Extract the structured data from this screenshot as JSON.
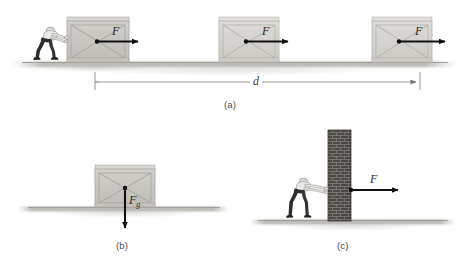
{
  "figure": {
    "background_color": "#ffffff",
    "width": 467,
    "height": 266
  },
  "colors": {
    "crate_face": "#c9c7c2",
    "crate_frame": "#b4b2ad",
    "crate_brace": "#a9a7a2",
    "ground": "#b9b7b2",
    "arrow": "#111111",
    "brick": "#4d4a47",
    "mortar": "#8e8b87",
    "person_shirt": "#e8e7e4",
    "person_pants": "#2e2c2b",
    "dimension_line": "#8f8d89",
    "caption_text": "#4a4a4a"
  },
  "panels": [
    {
      "id": "a",
      "caption": "(a)",
      "description": "Person pushes a crate a distance d along the ground",
      "crates": [
        {
          "index": 1,
          "force_label": "F",
          "has_person": true
        },
        {
          "index": 2,
          "force_label": "F",
          "has_person": false
        },
        {
          "index": 3,
          "force_label": "F",
          "has_person": false
        }
      ],
      "dimension": {
        "label": "d",
        "style": "double-ended-arrow"
      }
    },
    {
      "id": "b",
      "caption": "(b)",
      "description": "Crate at rest with gravitational force acting downward",
      "force_label": "F",
      "force_subscript": "g",
      "force_direction": "down"
    },
    {
      "id": "c",
      "caption": "(c)",
      "description": "Person pushes against a brick wall which does not move",
      "force_label": "F",
      "force_direction": "right",
      "obstacle": "brick-wall"
    }
  ]
}
